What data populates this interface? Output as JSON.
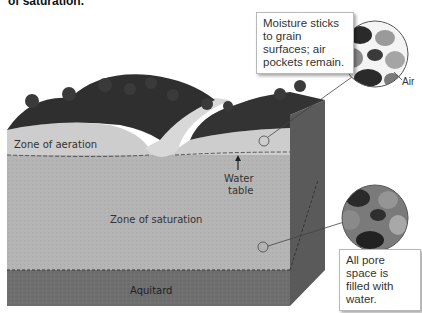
{
  "caption_fragment": "of saturation.",
  "callouts": {
    "aeration": "Moisture sticks to grain surfaces; air pockets remain.",
    "saturation": "All pore space is filled with water."
  },
  "labels": {
    "air": "Air",
    "zone_of_aeration": "Zone of aeration",
    "water_table_line1": "Water",
    "water_table_line2": "table",
    "zone_of_saturation": "Zone of saturation",
    "aquitard": "Aquitard"
  },
  "colors": {
    "background": "#ffffff",
    "aeration_zone": "#c9c9c9",
    "saturation_zone": "#b0b0b0",
    "aquitard": "#6e6e6e",
    "side_face": "#5a5a5a",
    "vegetation": "#2f2f2f",
    "river": "#d6d6d6"
  }
}
